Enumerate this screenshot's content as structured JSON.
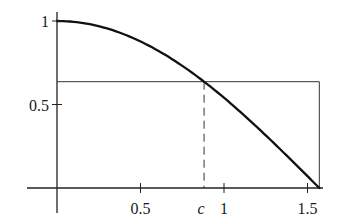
{
  "chart_data": {
    "type": "line",
    "title": "",
    "xlabel": "",
    "ylabel": "",
    "function": "cos(x)",
    "x_range": [
      0,
      1.5708
    ],
    "xlim": [
      -0.18,
      1.58
    ],
    "ylim": [
      -0.15,
      1.05
    ],
    "grid": false,
    "legend": null,
    "x_ticks": [
      {
        "value": 0.5,
        "label": "0.5"
      },
      {
        "value": 0.8807,
        "label": "c",
        "italic": true
      },
      {
        "value": 1,
        "label": "1"
      },
      {
        "value": 1.5,
        "label": "1.5"
      }
    ],
    "y_ticks": [
      {
        "value": 0.5,
        "label": "0.5"
      },
      {
        "value": 1,
        "label": "1"
      }
    ],
    "series": [
      {
        "name": "cos(x)",
        "style": "solid-thick",
        "x": [
          0,
          0.1,
          0.2,
          0.3,
          0.4,
          0.5,
          0.6,
          0.7,
          0.8,
          0.9,
          1.0,
          1.1,
          1.2,
          1.3,
          1.4,
          1.5,
          1.5708
        ],
        "y": [
          1,
          0.995,
          0.98,
          0.955,
          0.921,
          0.878,
          0.825,
          0.765,
          0.697,
          0.622,
          0.54,
          0.454,
          0.362,
          0.267,
          0.17,
          0.071,
          0
        ]
      }
    ],
    "annotations": {
      "rectangle": {
        "x0": 0,
        "x1": 1.5708,
        "height": 0.6366,
        "style": "thin-solid"
      },
      "c_marker": {
        "x": 0.8807,
        "y": 0.6366,
        "style": "dashed-vertical",
        "label": "c"
      }
    },
    "colors": {
      "curve": "#111111",
      "axes": "#222222",
      "rect": "#333333"
    }
  }
}
